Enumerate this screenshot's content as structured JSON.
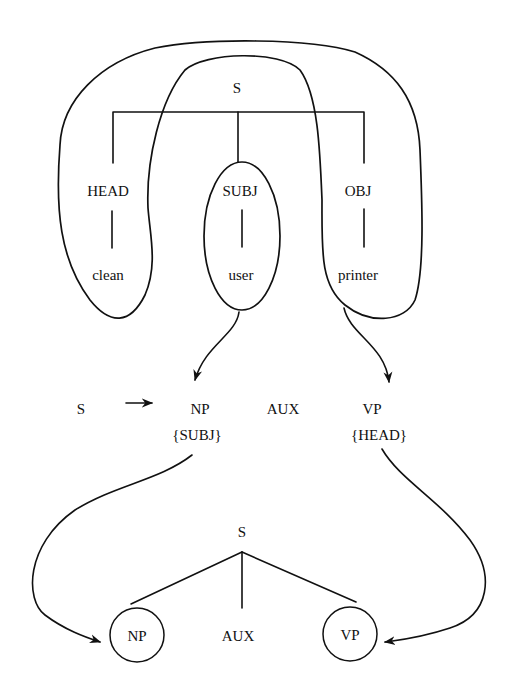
{
  "diagram": {
    "type": "feature-structure-to-phrase-structure mapping",
    "colors": {
      "ink": "#111111",
      "background": "#ffffff"
    },
    "functional_structure": {
      "root": "S",
      "features": [
        {
          "label": "HEAD",
          "value": "clean"
        },
        {
          "label": "SUBJ",
          "value": "user"
        },
        {
          "label": "OBJ",
          "value": "printer"
        }
      ],
      "groupings": [
        {
          "name": "outer-loop",
          "encloses": [
            "HEAD",
            "clean",
            "OBJ",
            "printer"
          ],
          "maps_to": "VP"
        },
        {
          "name": "subj-ellipse",
          "encloses": [
            "SUBJ",
            "user"
          ],
          "maps_to": "NP"
        }
      ]
    },
    "rule": {
      "lhs": "S",
      "arrow": "→",
      "rhs": [
        {
          "category": "NP",
          "annotation": "{SUBJ}"
        },
        {
          "category": "AUX",
          "annotation": ""
        },
        {
          "category": "VP",
          "annotation": "{HEAD}"
        }
      ]
    },
    "phrase_structure": {
      "root": "S",
      "children": [
        {
          "label": "NP",
          "circled": true
        },
        {
          "label": "AUX",
          "circled": false
        },
        {
          "label": "VP",
          "circled": true
        }
      ]
    }
  }
}
